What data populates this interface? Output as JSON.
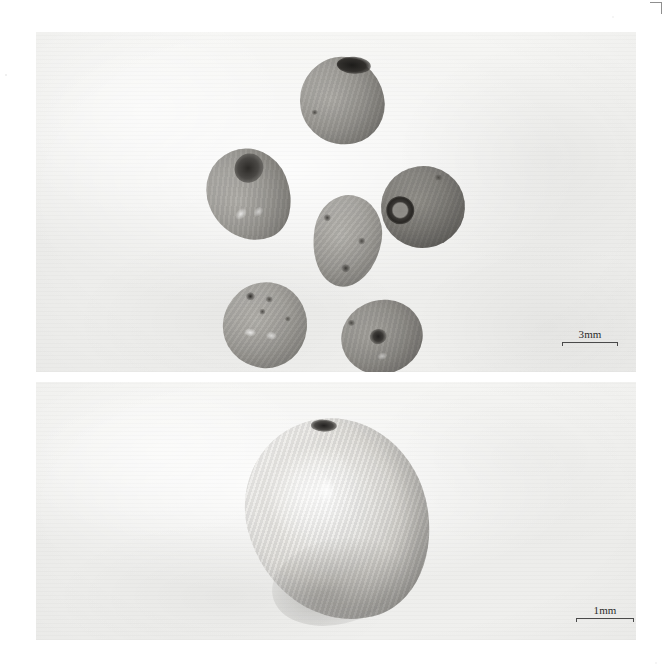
{
  "figure": {
    "type": "two-panel grayscale photographic plate",
    "background_color": "#ffffff",
    "panel_background_color": "#f1f1ef",
    "width": 665,
    "height": 672
  },
  "marks": {
    "crop_mark_name": "corner-registration-mark"
  },
  "panels": [
    {
      "id": "top-panel",
      "name": "seed-group-photograph",
      "scale_bar": {
        "label": "3mm",
        "length_px": 56,
        "position": "bottom-right"
      },
      "subject_count": 6,
      "subject_description": "six whole seeds arranged in a ring on a pale background",
      "seeds": [
        {
          "id": "seed-top",
          "label": "1",
          "tone": "#9a9893",
          "has_hilum": true,
          "hilum_type": "dark-elongated"
        },
        {
          "id": "seed-upper-left",
          "label": "2",
          "tone": "#9e9c97",
          "has_hilum": true,
          "hilum_type": "dark-patch"
        },
        {
          "id": "seed-right",
          "label": "3",
          "tone": "#7e7c78",
          "has_hilum": true,
          "hilum_type": "ringed-circular"
        },
        {
          "id": "seed-center",
          "label": "4",
          "tone": "#a3a19c",
          "has_hilum": false,
          "hilum_type": "none"
        },
        {
          "id": "seed-lower-left",
          "label": "5",
          "tone": "#a09e99",
          "has_hilum": false,
          "hilum_type": "none"
        },
        {
          "id": "seed-lower-right",
          "label": "6",
          "tone": "#8f8d88",
          "has_hilum": true,
          "hilum_type": "central-depression"
        }
      ]
    },
    {
      "id": "bottom-panel",
      "name": "single-seed-photograph",
      "scale_bar": {
        "label": "1mm",
        "length_px": 58,
        "position": "bottom-right"
      },
      "subject_count": 1,
      "subject_description": "single seed at higher magnification showing fine diagonal surface ridging",
      "seeds": [
        {
          "id": "seed-magnified",
          "label": "A",
          "tone": "#e3e1dc",
          "has_hilum": true,
          "hilum_type": "dark-apical-spot"
        }
      ]
    }
  ],
  "colors": {
    "text": "#2b2b2b",
    "rule": "#4a4a4a",
    "page": "#ffffff",
    "panel": "#f1f1ef"
  }
}
